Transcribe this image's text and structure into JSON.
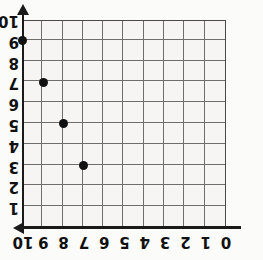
{
  "figure": {
    "name": "rotated-coordinate-grid",
    "orientation_degrees": 180,
    "background_color": "#fbfbfa",
    "grid_fill_color": "#f6f5f3",
    "grid_line_color": "#6e6e6e",
    "axis_color": "#1a1a1a",
    "point_color": "#111111"
  },
  "chart_data": {
    "type": "scatter",
    "title": "",
    "xlabel": "",
    "ylabel": "",
    "xlim": [
      0,
      10
    ],
    "ylim": [
      0,
      10
    ],
    "grid": true,
    "legend": null,
    "x_tick_labels": [
      "0",
      "1",
      "2",
      "3",
      "4",
      "5",
      "6",
      "7",
      "8",
      "9",
      "10"
    ],
    "y_tick_labels": [
      "0",
      "1",
      "2",
      "3",
      "4",
      "5",
      "6",
      "7",
      "8",
      "9",
      "10"
    ],
    "x_axis_direction": "right-to-left",
    "y_axis_direction": "top-to-bottom",
    "x_axis_arrow": "left",
    "y_axis_arrow": "down",
    "points": [
      {
        "x": 0,
        "y": 1
      },
      {
        "x": 1,
        "y": 3
      },
      {
        "x": 2,
        "y": 5
      },
      {
        "x": 3,
        "y": 7
      }
    ],
    "series": [
      {
        "name": "points",
        "x": [
          0,
          1,
          2,
          3
        ],
        "values": [
          1,
          3,
          5,
          7
        ]
      }
    ]
  }
}
